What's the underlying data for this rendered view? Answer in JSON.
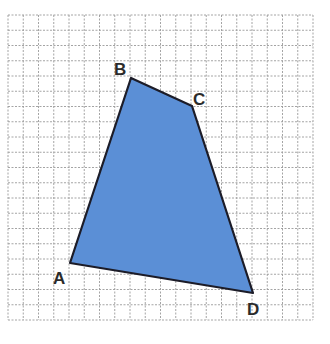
{
  "figure": {
    "type": "quadrilateral-on-grid",
    "grid": {
      "origin_x": 8,
      "origin_y": 15,
      "cell_size": 15.25,
      "cols": 20,
      "rows": 20,
      "line_color": "#9a9a9a"
    },
    "shape": {
      "fill": "#5b8fd6",
      "stroke": "#1c1c28",
      "vertices": [
        {
          "name": "A",
          "x": 70,
          "y": 263,
          "label_x": 53,
          "label_y": 284
        },
        {
          "name": "B",
          "x": 131,
          "y": 78,
          "label_x": 114,
          "label_y": 75
        },
        {
          "name": "C",
          "x": 192,
          "y": 106,
          "label_x": 193,
          "label_y": 105
        },
        {
          "name": "D",
          "x": 253,
          "y": 293,
          "label_x": 247,
          "label_y": 315
        }
      ]
    },
    "labels": {
      "A": "A",
      "B": "B",
      "C": "C",
      "D": "D"
    }
  }
}
